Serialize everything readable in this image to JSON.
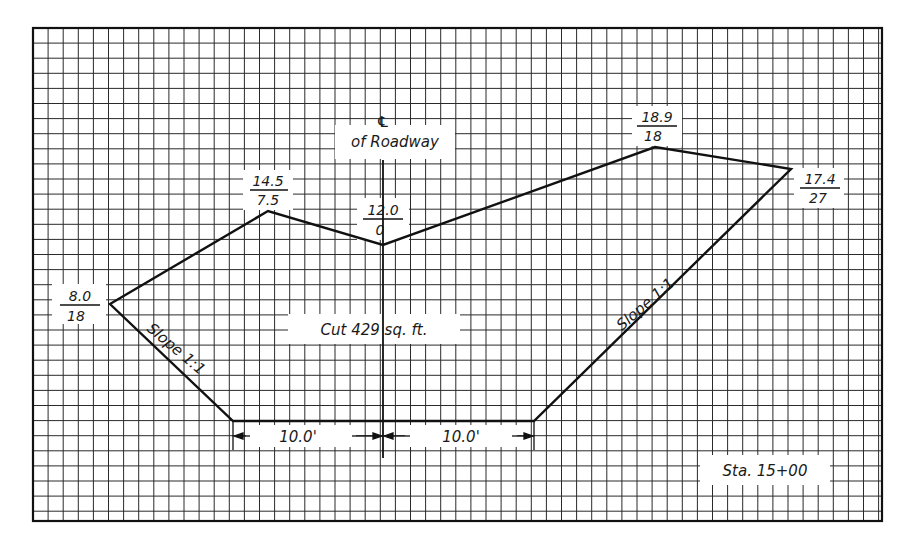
{
  "diagram": {
    "type": "roadway-cross-section",
    "grid": {
      "spacing_px": 15.1,
      "origin": [
        33,
        28
      ],
      "extent": [
        882,
        521
      ],
      "line_color": "#222222",
      "frame_color": "#111111"
    },
    "centerline": {
      "symbol": "℄",
      "label": "of Roadway",
      "x": 383
    },
    "points": [
      {
        "id": "left-catch",
        "numerator": "8.0",
        "denominator": "18",
        "x": 110,
        "y": 304
      },
      {
        "id": "left-break",
        "numerator": "14.5",
        "denominator": "7.5",
        "x": 268,
        "y": 211
      },
      {
        "id": "center",
        "numerator": "12.0",
        "denominator": "0",
        "x": 383,
        "y": 245
      },
      {
        "id": "right-break",
        "numerator": "18.9",
        "denominator": "18",
        "x": 655,
        "y": 147
      },
      {
        "id": "right-catch",
        "numerator": "17.4",
        "denominator": "27",
        "x": 791,
        "y": 169
      }
    ],
    "subgrade": {
      "left_x": 233,
      "right_x": 534,
      "y": 421
    },
    "slopes": {
      "left": "Slope 1:1",
      "right": "Slope 1:1"
    },
    "dimensions": {
      "left": "10.0'",
      "right": "10.0'"
    },
    "area_label": "Cut 429 sq. ft.",
    "station": "Sta. 15+00"
  }
}
